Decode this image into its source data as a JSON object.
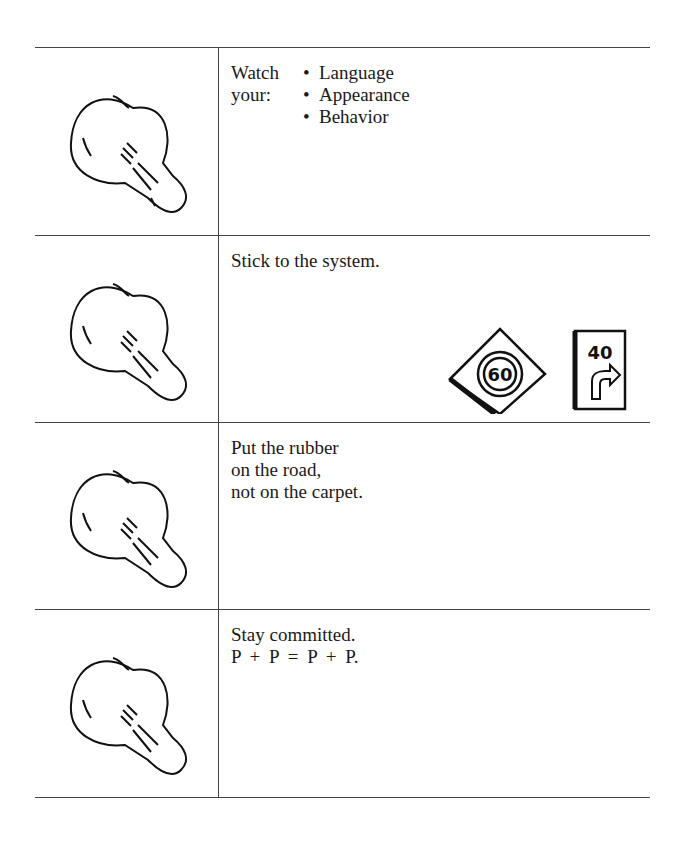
{
  "rows": [
    {
      "lead": "Watch your:",
      "bullets": [
        "Language",
        "Appearance",
        "Behavior"
      ]
    },
    {
      "text": "Stick to the system.",
      "illustration": {
        "sign_left": "60",
        "sign_right": "40"
      }
    },
    {
      "lines": [
        "Put the rubber",
        "on the road,",
        "not on the carpet."
      ]
    },
    {
      "lines": [
        "Stay committed.",
        "P + P = P + P."
      ]
    }
  ]
}
